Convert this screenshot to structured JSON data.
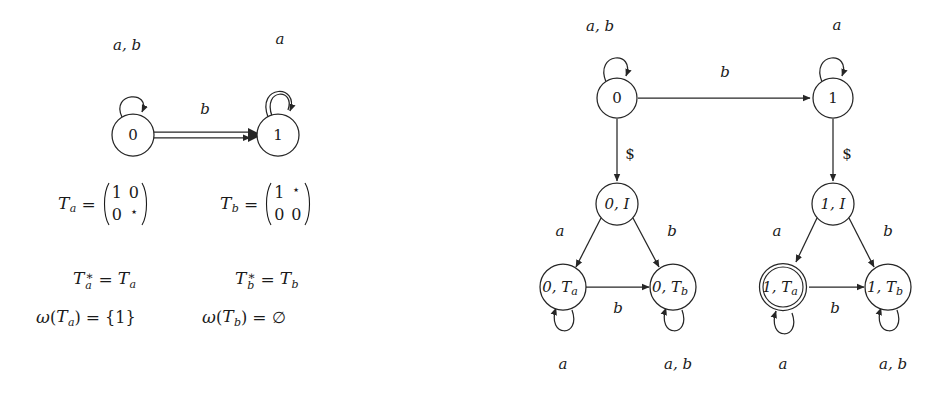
{
  "figure": {
    "background_color": "#ffffff",
    "ink_color": "#262626"
  },
  "left_automaton": {
    "name": "source-automaton",
    "states": [
      {
        "id": "q0",
        "label": "0",
        "accepting": false,
        "cx": 133,
        "cy": 135,
        "r": 21
      },
      {
        "id": "q1",
        "label": "1",
        "accepting": false,
        "cx": 278,
        "cy": 135,
        "r": 21
      }
    ],
    "self_loops": [
      {
        "on": "q0",
        "label": "a, b",
        "label_x": 127,
        "label_y": 46,
        "double": false
      },
      {
        "on": "q1",
        "label": "a",
        "label_x": 280,
        "label_y": 40,
        "double": true
      }
    ],
    "transitions": [
      {
        "from": "q0",
        "to": "q1",
        "label": "b",
        "label_x": 205,
        "label_y": 110,
        "double": true
      }
    ]
  },
  "math": {
    "rows": [
      {
        "id": "Ta-def",
        "lhs": "T",
        "lhs_sub": "a",
        "relation": "=",
        "matrix": [
          [
            "1",
            "0"
          ],
          [
            "0",
            "⋆"
          ]
        ]
      },
      {
        "id": "Tb-def",
        "lhs": "T",
        "lhs_sub": "b",
        "relation": "=",
        "matrix": [
          [
            "1",
            "⋆"
          ],
          [
            "0",
            "0"
          ]
        ]
      },
      {
        "id": "Ta-star",
        "text_lhs": "T",
        "lhs_sub": "a",
        "lhs_sup": "∗",
        "relation": "=",
        "rhs": "T",
        "rhs_sub": "a"
      },
      {
        "id": "Tb-star",
        "text_lhs": "T",
        "lhs_sub": "b",
        "lhs_sup": "∗",
        "relation": "=",
        "rhs": "T",
        "rhs_sub": "b"
      },
      {
        "id": "omega-Ta",
        "omega": "ω",
        "arg": "T",
        "arg_sub": "a",
        "relation": "=",
        "value": "{1}"
      },
      {
        "id": "omega-Tb",
        "omega": "ω",
        "arg": "T",
        "arg_sub": "b",
        "relation": "=",
        "value": "∅"
      }
    ]
  },
  "right_automaton": {
    "name": "product-automaton",
    "states": [
      {
        "id": "r0",
        "label": "0",
        "sub": "",
        "accepting": false,
        "cx": 617,
        "cy": 98,
        "r": 20
      },
      {
        "id": "r1",
        "label": "1",
        "sub": "",
        "accepting": false,
        "cx": 833,
        "cy": 98,
        "r": 20
      },
      {
        "id": "r0I",
        "label": "0, I",
        "sub": "",
        "accepting": false,
        "cx": 617,
        "cy": 204,
        "r": 21
      },
      {
        "id": "r1I",
        "label": "1, I",
        "sub": "",
        "accepting": false,
        "cx": 833,
        "cy": 204,
        "r": 21
      },
      {
        "id": "r0Ta",
        "label": "0, T",
        "sub": "a",
        "accepting": false,
        "cx": 563,
        "cy": 287,
        "r": 23
      },
      {
        "id": "r0Tb",
        "label": "0, T",
        "sub": "b",
        "accepting": false,
        "cx": 673,
        "cy": 287,
        "r": 23
      },
      {
        "id": "r1Ta",
        "label": "1, T",
        "sub": "a",
        "accepting": true,
        "cx": 783,
        "cy": 287,
        "r": 23
      },
      {
        "id": "r1Tb",
        "label": "1, T",
        "sub": "b",
        "accepting": false,
        "cx": 888,
        "cy": 287,
        "r": 23
      }
    ],
    "self_loops": [
      {
        "on": "r0",
        "label": "a, b",
        "label_x": 600,
        "label_y": 27,
        "position": "top"
      },
      {
        "on": "r1",
        "label": "a",
        "label_x": 837,
        "label_y": 26,
        "position": "top"
      },
      {
        "on": "r0Ta",
        "label": "a",
        "label_x": 563,
        "label_y": 365,
        "position": "bottom"
      },
      {
        "on": "r0Tb",
        "label": "a, b",
        "label_x": 678,
        "label_y": 365,
        "position": "bottom"
      },
      {
        "on": "r1Ta",
        "label": "a",
        "label_x": 783,
        "label_y": 365,
        "position": "bottom"
      },
      {
        "on": "r1Tb",
        "label": "a, b",
        "label_x": 893,
        "label_y": 365,
        "position": "bottom"
      }
    ],
    "transitions": [
      {
        "from": "r0",
        "to": "r1",
        "label": "b",
        "label_x": 725,
        "label_y": 73,
        "kind": "horizontal"
      },
      {
        "from": "r0",
        "to": "r0I",
        "label": "$",
        "label_x": 630,
        "label_y": 155,
        "kind": "vertical"
      },
      {
        "from": "r1",
        "to": "r1I",
        "label": "$",
        "label_x": 847,
        "label_y": 155,
        "kind": "vertical"
      },
      {
        "from": "r0I",
        "to": "r0Ta",
        "label": "a",
        "label_x": 560,
        "label_y": 232,
        "kind": "diagonal"
      },
      {
        "from": "r0I",
        "to": "r0Tb",
        "label": "b",
        "label_x": 672,
        "label_y": 232,
        "kind": "diagonal"
      },
      {
        "from": "r1I",
        "to": "r1Ta",
        "label": "a",
        "label_x": 777,
        "label_y": 232,
        "kind": "diagonal"
      },
      {
        "from": "r1I",
        "to": "r1Tb",
        "label": "b",
        "label_x": 888,
        "label_y": 232,
        "kind": "diagonal"
      },
      {
        "from": "r0Ta",
        "to": "r0Tb",
        "label": "b",
        "label_x": 618,
        "label_y": 307,
        "kind": "horizontal"
      },
      {
        "from": "r1Ta",
        "to": "r1Tb",
        "label": "b",
        "label_x": 835,
        "label_y": 307,
        "kind": "horizontal"
      }
    ]
  }
}
